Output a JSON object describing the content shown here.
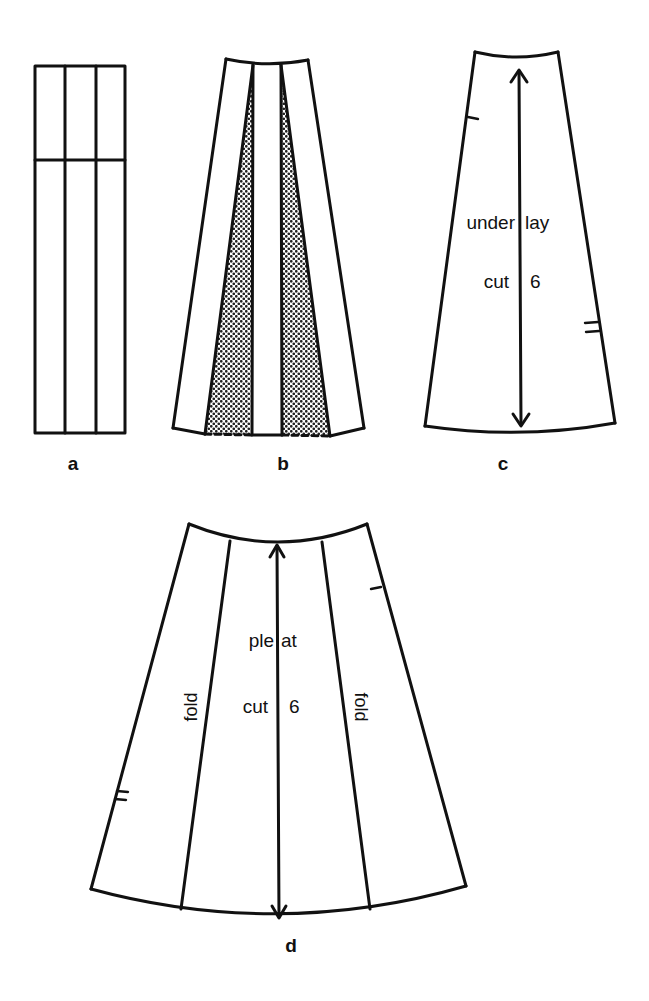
{
  "figure": {
    "panels": [
      {
        "id": "a",
        "label": "a"
      },
      {
        "id": "b",
        "label": "b"
      },
      {
        "id": "c",
        "label": "c",
        "text_lines": [
          {
            "left": "under",
            "right": "lay"
          },
          {
            "left": "cut",
            "right": "6"
          }
        ]
      },
      {
        "id": "d",
        "label": "d",
        "text_lines": [
          {
            "left": "ple",
            "right": "at"
          },
          {
            "left": "cut",
            "right": "6"
          }
        ],
        "fold_labels": [
          "fold",
          "fold"
        ]
      }
    ],
    "colors": {
      "line": "#111111",
      "background": "#ffffff",
      "shading": "#333333"
    }
  }
}
